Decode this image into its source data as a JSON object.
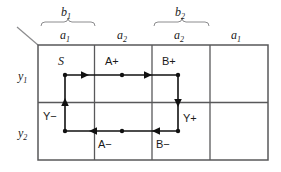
{
  "figure": {
    "kind": "primitive-flow-table",
    "title_visible": false,
    "colors": {
      "grid": "#58585a",
      "flow": "#111111",
      "brace": "#8c8c8e",
      "text": "#1a1a1a",
      "background": "#ffffff"
    }
  },
  "column_groups": [
    {
      "label": "b",
      "sub": "1",
      "subcolumns": [
        {
          "label": "a",
          "sub": "1"
        },
        {
          "label": "a",
          "sub": "2"
        }
      ]
    },
    {
      "label": "b",
      "sub": "2",
      "subcolumns": [
        {
          "label": "a",
          "sub": "2"
        },
        {
          "label": "a",
          "sub": "1"
        }
      ]
    }
  ],
  "row_labels": [
    {
      "label": "y",
      "sub": "1"
    },
    {
      "label": "y",
      "sub": "2"
    }
  ],
  "cells": [
    {
      "row": "y1",
      "column": "b1a1",
      "text": "S",
      "style": "italic"
    },
    {
      "row": "y1",
      "column": "b1a2",
      "text": "A+",
      "style": "upright"
    },
    {
      "row": "y1",
      "column": "b2a2",
      "text": "B+",
      "style": "upright"
    },
    {
      "row": "y1",
      "column": "b2a1",
      "text": "",
      "style": "upright"
    },
    {
      "row": "y2",
      "column": "b1a1",
      "text": "",
      "style": "upright"
    },
    {
      "row": "y2",
      "column": "b1a2",
      "text": "A−",
      "style": "upright"
    },
    {
      "row": "y2",
      "column": "b2a2",
      "text": "B−",
      "style": "upright"
    },
    {
      "row": "y2",
      "column": "b2a1",
      "text": "",
      "style": "upright"
    }
  ],
  "transition_labels": [
    {
      "text": "Y−",
      "position": "left-middle"
    },
    {
      "text": "Y+",
      "position": "right-middle"
    }
  ],
  "cycle_path": {
    "description": "closed primitive cycle S → A+ → B+ → Y+ → B− → A− → Y− → S",
    "steps": [
      "S",
      "A+",
      "B+",
      "Y+",
      "B−",
      "A−",
      "Y−"
    ]
  }
}
